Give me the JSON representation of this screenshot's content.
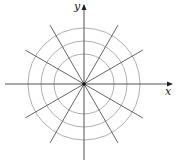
{
  "diagram": {
    "center": [
      84,
      84
    ],
    "axes": {
      "x_label": "x",
      "y_label": "y",
      "x_range_px": [
        5,
        170
      ],
      "y_range_px": [
        5,
        160
      ]
    },
    "rings": [
      30,
      43,
      56
    ],
    "rays": {
      "angles_deg": [
        30,
        60,
        120,
        150,
        210,
        240,
        300,
        330
      ],
      "length": 68
    },
    "colors": {
      "axis": "#555555",
      "ray": "#666666",
      "ring": "#b0b0b0",
      "origin": "#111111"
    }
  }
}
